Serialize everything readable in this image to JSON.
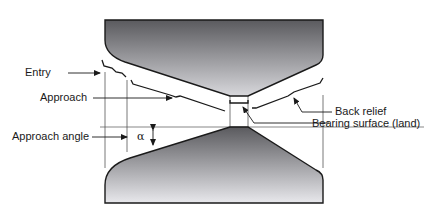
{
  "figure": {
    "labels": {
      "entry": "Entry",
      "approach": "Approach",
      "approach_angle": "Approach angle",
      "alpha_symbol": "α",
      "back_relief": "Back relief",
      "bearing_surface": "Bearing surface (land)"
    },
    "colors": {
      "die_dark": "#5e5e62",
      "die_light": "#e6e6ea",
      "outline": "#1a1a1a",
      "leader": "#333333"
    }
  }
}
